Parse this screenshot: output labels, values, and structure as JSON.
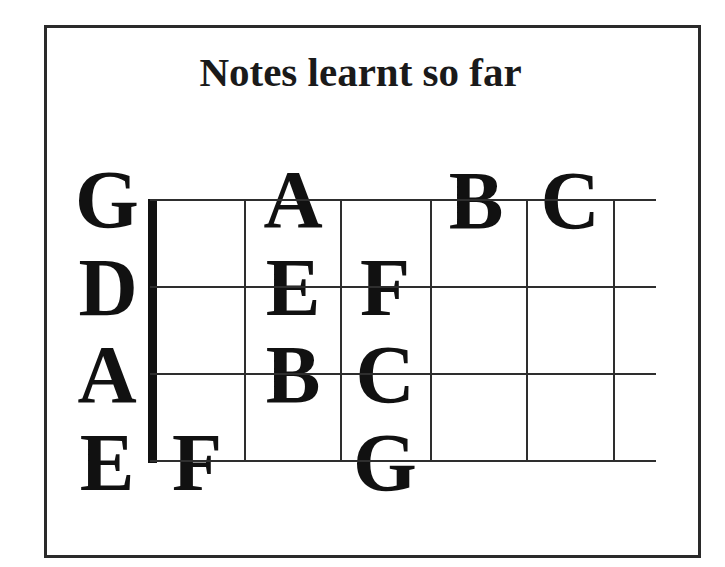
{
  "title": "Notes learnt so far",
  "fretboard": {
    "strings": [
      {
        "name": "G",
        "y": 200
      },
      {
        "name": "D",
        "y": 287
      },
      {
        "name": "A",
        "y": 374
      },
      {
        "name": "E",
        "y": 461
      }
    ],
    "frets_x": [
      245,
      341,
      431,
      527,
      614
    ],
    "nut_x": 148,
    "string_end_x": 656,
    "notes": [
      {
        "string": "G",
        "fret": 2,
        "note": "A"
      },
      {
        "string": "G",
        "fret": 4,
        "note": "B"
      },
      {
        "string": "G",
        "fret": 5,
        "note": "C"
      },
      {
        "string": "D",
        "fret": 2,
        "note": "E"
      },
      {
        "string": "D",
        "fret": 3,
        "note": "F"
      },
      {
        "string": "A",
        "fret": 2,
        "note": "B"
      },
      {
        "string": "A",
        "fret": 3,
        "note": "C"
      },
      {
        "string": "E",
        "fret": 1,
        "note": "F"
      },
      {
        "string": "E",
        "fret": 3,
        "note": "G"
      }
    ]
  },
  "labels": {
    "string_g": "G",
    "string_d": "D",
    "string_a": "A",
    "string_e": "E",
    "g_fret2": "A",
    "g_fret4": "B",
    "g_fret5": "C",
    "d_fret2": "E",
    "d_fret3": "F",
    "a_fret2": "B",
    "a_fret3": "C",
    "e_fret1": "F",
    "e_fret3": "G"
  },
  "colors": {
    "ink": "#111111",
    "line": "#2e2e2e",
    "background": "#ffffff"
  }
}
